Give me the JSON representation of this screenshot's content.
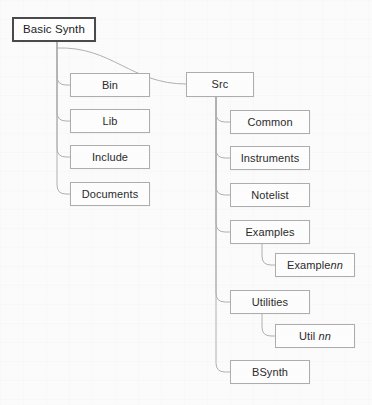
{
  "diagram": {
    "type": "tree",
    "colors": {
      "background": "#fbfbfb",
      "box_fill": "#fdfdfd",
      "box_border": "#adadad",
      "root_border": "#4a4a4a",
      "connector": "#b0b0b0",
      "text": "#2b2b2b"
    },
    "root": {
      "label": "Basic Synth",
      "x": 12,
      "y": 17,
      "w": 84,
      "h": 25
    },
    "nodes": [
      {
        "id": "bin",
        "label": "Bin",
        "prefix": "Bin",
        "var": "",
        "x": 70,
        "y": 73,
        "w": 80,
        "h": 24,
        "level": 1
      },
      {
        "id": "lib",
        "label": "Lib",
        "prefix": "Lib",
        "var": "",
        "x": 70,
        "y": 109,
        "w": 80,
        "h": 24,
        "level": 1
      },
      {
        "id": "include",
        "label": "Include",
        "prefix": "Include",
        "var": "",
        "x": 70,
        "y": 145,
        "w": 80,
        "h": 24,
        "level": 1
      },
      {
        "id": "documents",
        "label": "Documents",
        "prefix": "Documents",
        "var": "",
        "x": 70,
        "y": 182,
        "w": 80,
        "h": 24,
        "level": 1
      },
      {
        "id": "src",
        "label": "Src",
        "prefix": "Src",
        "var": "",
        "x": 186,
        "y": 72,
        "w": 68,
        "h": 25,
        "level": 1
      },
      {
        "id": "common",
        "label": "Common",
        "prefix": "Common",
        "var": "",
        "x": 230,
        "y": 110,
        "w": 80,
        "h": 24,
        "level": 2
      },
      {
        "id": "instruments",
        "label": "Instruments",
        "prefix": "Instruments",
        "var": "",
        "x": 230,
        "y": 146,
        "w": 80,
        "h": 24,
        "level": 2
      },
      {
        "id": "notelist",
        "label": "Notelist",
        "prefix": "Notelist",
        "var": "",
        "x": 230,
        "y": 183,
        "w": 80,
        "h": 24,
        "level": 2
      },
      {
        "id": "examples",
        "label": "Examples",
        "prefix": "Examples",
        "var": "",
        "x": 230,
        "y": 220,
        "w": 80,
        "h": 24,
        "level": 2
      },
      {
        "id": "examplenn",
        "label": "Examplenn",
        "prefix": "Example",
        "var": "nn",
        "x": 275,
        "y": 253,
        "w": 80,
        "h": 24,
        "level": 3
      },
      {
        "id": "utilities",
        "label": "Utilities",
        "prefix": "Utilities",
        "var": "",
        "x": 230,
        "y": 290,
        "w": 80,
        "h": 24,
        "level": 2
      },
      {
        "id": "utilnn",
        "label": "Util nn",
        "prefix": "Util ",
        "var": "nn",
        "x": 275,
        "y": 324,
        "w": 80,
        "h": 24,
        "level": 3
      },
      {
        "id": "bsynth",
        "label": "BSynth",
        "prefix": "BSynth",
        "var": "",
        "x": 230,
        "y": 360,
        "w": 80,
        "h": 24,
        "level": 2
      }
    ],
    "edges": [
      {
        "from": "root",
        "to": "bin",
        "kind": "elbow",
        "trunk_x": 57,
        "start_y": 42,
        "end_y": 85
      },
      {
        "from": "root",
        "to": "lib",
        "kind": "elbow",
        "trunk_x": 57,
        "start_y": 42,
        "end_y": 121
      },
      {
        "from": "root",
        "to": "include",
        "kind": "elbow",
        "trunk_x": 57,
        "start_y": 42,
        "end_y": 157
      },
      {
        "from": "root",
        "to": "documents",
        "kind": "elbow",
        "trunk_x": 57,
        "start_y": 42,
        "end_y": 194
      },
      {
        "from": "root",
        "to": "src",
        "kind": "curve",
        "trunk_x": 57,
        "start_y": 48,
        "end_y": 84
      },
      {
        "from": "src",
        "to": "common",
        "kind": "elbow",
        "trunk_x": 216,
        "start_y": 97,
        "end_y": 122
      },
      {
        "from": "src",
        "to": "instruments",
        "kind": "elbow",
        "trunk_x": 216,
        "start_y": 97,
        "end_y": 158
      },
      {
        "from": "src",
        "to": "notelist",
        "kind": "elbow",
        "trunk_x": 216,
        "start_y": 97,
        "end_y": 195
      },
      {
        "from": "src",
        "to": "examples",
        "kind": "elbow",
        "trunk_x": 216,
        "start_y": 97,
        "end_y": 232
      },
      {
        "from": "src",
        "to": "utilities",
        "kind": "elbow",
        "trunk_x": 216,
        "start_y": 97,
        "end_y": 302
      },
      {
        "from": "src",
        "to": "bsynth",
        "kind": "elbow",
        "trunk_x": 216,
        "start_y": 97,
        "end_y": 372
      },
      {
        "from": "examples",
        "to": "examplenn",
        "kind": "elbow",
        "trunk_x": 262,
        "start_y": 244,
        "end_y": 265
      },
      {
        "from": "utilities",
        "to": "utilnn",
        "kind": "elbow",
        "trunk_x": 262,
        "start_y": 314,
        "end_y": 336
      }
    ]
  }
}
